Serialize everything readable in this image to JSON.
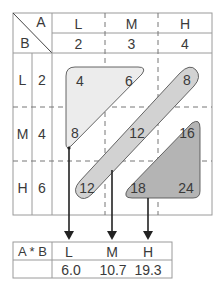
{
  "diagram": {
    "top_table": {
      "corner": {
        "col_header_label": "A",
        "row_header_label": "B"
      },
      "columns": [
        {
          "level": "L",
          "value": "2"
        },
        {
          "level": "M",
          "value": "3"
        },
        {
          "level": "H",
          "value": "4"
        }
      ],
      "rows": [
        {
          "level": "L",
          "value": "2",
          "cells": [
            "4",
            "6",
            "8"
          ]
        },
        {
          "level": "M",
          "value": "4",
          "cells": [
            "8",
            "12",
            "16"
          ]
        },
        {
          "level": "H",
          "value": "6",
          "cells": [
            "12",
            "18",
            "24"
          ]
        }
      ]
    },
    "groups": [
      {
        "name": "L",
        "members": [
          "4",
          "6",
          "8"
        ],
        "fill": "#ececec",
        "mean": "6.0"
      },
      {
        "name": "M",
        "members": [
          "8",
          "12",
          "12"
        ],
        "fill": "#d2d2d2",
        "mean": "10.7"
      },
      {
        "name": "H",
        "members": [
          "16",
          "18",
          "24"
        ],
        "fill": "#b4b4b4",
        "mean": "19.3"
      }
    ],
    "bottom_table": {
      "header_label": "A * B",
      "columns": [
        "L",
        "M",
        "H"
      ],
      "values": [
        "6.0",
        "10.7",
        "19.3"
      ]
    },
    "colors": {
      "grid_line": "#9a9a9a",
      "shape_stroke": "#555555",
      "arrow": "#222222",
      "light_fill": "#ececec",
      "mid_fill": "#d2d2d2",
      "dark_fill": "#b4b4b4"
    }
  }
}
